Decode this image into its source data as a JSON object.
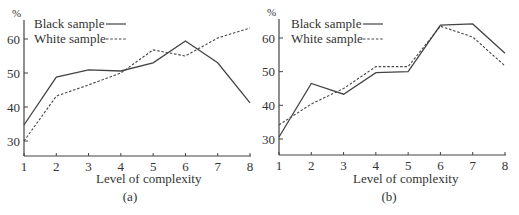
{
  "chart_data": [
    {
      "type": "line",
      "panel": "(a)",
      "title": "",
      "xlabel": "Level of complexity",
      "ylabel": "%",
      "x": [
        1,
        2,
        3,
        4,
        5,
        6,
        7,
        8
      ],
      "xticks": [
        "1",
        "2",
        "3",
        "4",
        "5",
        "6",
        "7",
        "8"
      ],
      "yticks": [
        "30",
        "40",
        "50",
        "60"
      ],
      "ylim": [
        25,
        66
      ],
      "grid": false,
      "legend_position": "upper-left",
      "series": [
        {
          "name": "Black sample",
          "style": "solid",
          "values": [
            34.7,
            48.8,
            50.9,
            50.6,
            53.0,
            59.4,
            53.0,
            41.2
          ]
        },
        {
          "name": "White sample",
          "style": "dashed",
          "values": [
            30.0,
            43.2,
            46.5,
            50.0,
            56.8,
            55.0,
            60.3,
            63.2
          ]
        }
      ]
    },
    {
      "type": "line",
      "panel": "(b)",
      "title": "",
      "xlabel": "Level of complexity",
      "ylabel": "%",
      "x": [
        1,
        2,
        3,
        4,
        5,
        6,
        7,
        8
      ],
      "xticks": [
        "1",
        "2",
        "3",
        "4",
        "5",
        "6",
        "7",
        "8"
      ],
      "yticks": [
        "30",
        "40",
        "50",
        "60"
      ],
      "ylim": [
        25,
        66
      ],
      "grid": false,
      "legend_position": "upper-left",
      "series": [
        {
          "name": "Black sample",
          "style": "solid",
          "values": [
            30.6,
            46.5,
            43.3,
            49.7,
            50.0,
            63.8,
            64.2,
            55.5
          ]
        },
        {
          "name": "White sample",
          "style": "dashed",
          "values": [
            34.2,
            40.4,
            45.0,
            51.5,
            51.5,
            63.5,
            60.3,
            51.7
          ]
        }
      ]
    }
  ],
  "panels": {
    "a": {
      "caption": "(a)",
      "xlabel": "Level of complexity",
      "ylabel": "%",
      "legend_black": "Black sample",
      "legend_white": "White sample"
    },
    "b": {
      "caption": "(b)",
      "xlabel": "Level of complexity",
      "ylabel": "%",
      "legend_black": "Black sample",
      "legend_white": "White sample"
    }
  },
  "colors": {
    "line": "#444444",
    "axis": "#444444",
    "text": "#333333"
  }
}
